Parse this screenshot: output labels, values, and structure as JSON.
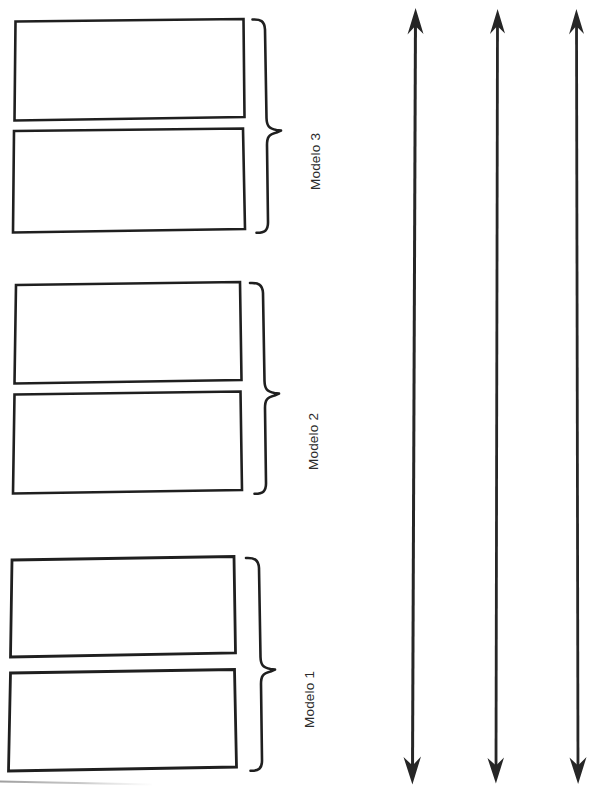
{
  "document": {
    "kind": "scanned-diagram",
    "orientation": "rotated-90",
    "background_color": "#ffffff",
    "ink_color": "#1f1f1f",
    "faint_line_color": "#b4b4b4"
  },
  "groups": [
    {
      "id": "modelo-3",
      "label": "Modelo 3",
      "label_rotation_deg": -90,
      "brace": {
        "icon": "curly-brace-rotated-icon",
        "tip_direction": "right"
      },
      "panels": [
        {
          "id": "modelo-3-panel-a",
          "name": "panel",
          "content": ""
        },
        {
          "id": "modelo-3-panel-b",
          "name": "panel",
          "content": ""
        }
      ]
    },
    {
      "id": "modelo-2",
      "label": "Modelo 2",
      "label_rotation_deg": -90,
      "brace": {
        "icon": "curly-brace-rotated-icon",
        "tip_direction": "right"
      },
      "panels": [
        {
          "id": "modelo-2-panel-a",
          "name": "panel",
          "content": ""
        },
        {
          "id": "modelo-2-panel-b",
          "name": "panel",
          "content": ""
        }
      ]
    },
    {
      "id": "modelo-1",
      "label": "Modelo 1",
      "label_rotation_deg": -90,
      "brace": {
        "icon": "curly-brace-rotated-icon",
        "tip_direction": "right"
      },
      "panels": [
        {
          "id": "modelo-1-panel-a",
          "name": "panel",
          "content": ""
        },
        {
          "id": "modelo-1-panel-b",
          "name": "panel",
          "content": ""
        }
      ]
    }
  ],
  "arrows": [
    {
      "id": "arrow-1",
      "icon": "double-headed-arrow-vertical-icon",
      "label": ""
    },
    {
      "id": "arrow-2",
      "icon": "double-headed-arrow-vertical-icon",
      "label": ""
    },
    {
      "id": "arrow-3",
      "icon": "double-headed-arrow-vertical-icon",
      "label": ""
    }
  ],
  "artifacts": {
    "bottom_edge_line": {
      "icon": "page-edge-line-icon",
      "label": ""
    }
  }
}
